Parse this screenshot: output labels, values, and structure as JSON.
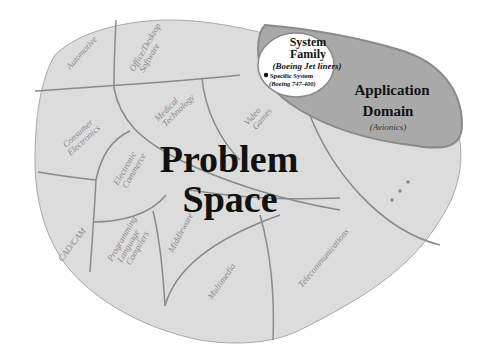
{
  "diagram": {
    "title_line1": "Problem",
    "title_line2": "Space",
    "colors": {
      "background": "#ffffff",
      "problem_space_fill": "#dcdcdc",
      "boundary_lines": "#8a8a8a",
      "application_domain_fill": "#a9a9a9",
      "system_family_fill": "#ffffff",
      "text_dark": "#111111",
      "text_region": "#8a8a8a"
    },
    "regions": [
      {
        "label_line1": "Automotive",
        "label_line2": ""
      },
      {
        "label_line1": "Office/Desktop",
        "label_line2": "Software"
      },
      {
        "label_line1": "Consumer",
        "label_line2": "Electronics"
      },
      {
        "label_line1": "Medical",
        "label_line2": "Technology"
      },
      {
        "label_line1": "Video",
        "label_line2": "Games"
      },
      {
        "label_line1": "Electronic",
        "label_line2": "Commerce"
      },
      {
        "label_line1": "CAD/CAM",
        "label_line2": ""
      },
      {
        "label_line1": "Programming",
        "label_line2": "Language",
        "label_line3": "Compilers"
      },
      {
        "label_line1": "Middleware",
        "label_line2": ""
      },
      {
        "label_line1": "Multimedia",
        "label_line2": ""
      },
      {
        "label_line1": "Telecommunications",
        "label_line2": ""
      }
    ],
    "application_domain": {
      "label_line1": "Application",
      "label_line2": "Domain",
      "example": "(Avionics)"
    },
    "system_family": {
      "label_line1": "System",
      "label_line2": "Family",
      "example": "(Boeing Jet liners)"
    },
    "specific_system": {
      "label": "Specific System",
      "example": "(Boeing 747-400)"
    },
    "ellipsis_dots": 3
  }
}
